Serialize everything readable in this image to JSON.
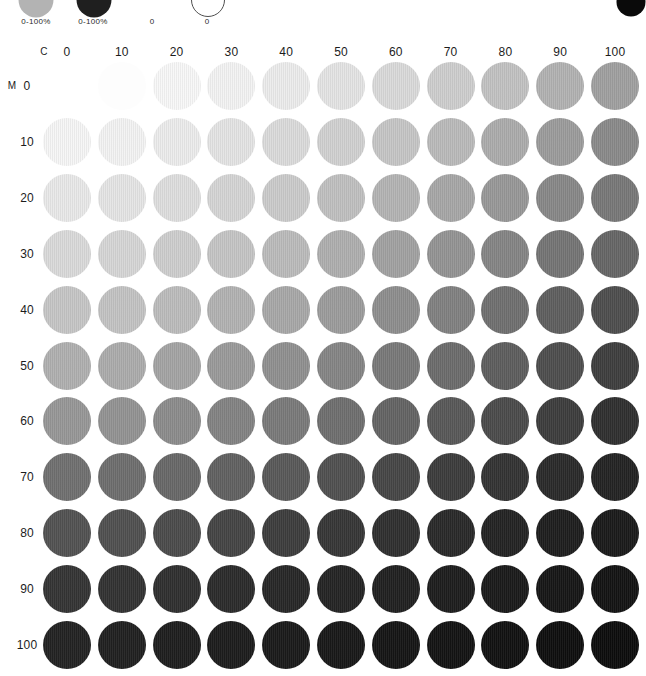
{
  "page": {
    "background": "#ffffff",
    "text_color": "#1c1c1c"
  },
  "legend": {
    "items": [
      {
        "id": "cyan-scale",
        "label": "0-100%",
        "swatch_style": "filled",
        "swatch_color": "#b3b3b3"
      },
      {
        "id": "magenta-scale",
        "label": "0-100%",
        "swatch_style": "filled",
        "swatch_color": "#1f1f1f"
      },
      {
        "id": "yellow-zero",
        "label": "0",
        "swatch_style": "invisible",
        "swatch_color": "#ffffff"
      },
      {
        "id": "black-zero",
        "label": "0",
        "swatch_style": "outlined",
        "swatch_color": "#ffffff",
        "outline_color": "#4f4f4f"
      }
    ]
  },
  "corner_dot": {
    "color": "#0a0a0a"
  },
  "chart_data": {
    "type": "heatmap",
    "x_axis_label": "C",
    "y_axis_label": "M",
    "x_ticks": [
      "0",
      "10",
      "20",
      "30",
      "40",
      "50",
      "60",
      "70",
      "80",
      "90",
      "100"
    ],
    "y_ticks": [
      "0",
      "10",
      "20",
      "30",
      "40",
      "50",
      "60",
      "70",
      "80",
      "90",
      "100"
    ],
    "x_range": [
      0,
      100
    ],
    "y_range": [
      0,
      100
    ],
    "grid": false,
    "legend_position": "top-left",
    "cell_colors": [
      [
        "#ffffff",
        "#fdfdfd",
        "#f8f8f8",
        "#f3f3f3",
        "#ececec",
        "#e4e4e4",
        "#dadada",
        "#cecece",
        "#c2c2c2",
        "#b2b2b2",
        "#a0a0a0"
      ],
      [
        "#f6f6f6",
        "#f3f3f3",
        "#ececec",
        "#e4e4e4",
        "#dbdbdb",
        "#d1d1d1",
        "#c6c6c6",
        "#bababa",
        "#acacac",
        "#9c9c9c",
        "#8a8a8a"
      ],
      [
        "#e9e9e9",
        "#e5e5e5",
        "#dedede",
        "#d5d5d5",
        "#cbcbcb",
        "#c0c0c0",
        "#b4b4b4",
        "#a7a7a7",
        "#989898",
        "#888888",
        "#787878"
      ],
      [
        "#dadada",
        "#d6d6d6",
        "#cecece",
        "#c5c5c5",
        "#bbbbbb",
        "#afafaf",
        "#a2a2a2",
        "#949494",
        "#858585",
        "#757575",
        "#666666"
      ],
      [
        "#c6c6c6",
        "#c3c3c3",
        "#bcbcbc",
        "#b2b2b2",
        "#a8a8a8",
        "#9c9c9c",
        "#8e8e8e",
        "#818181",
        "#707070",
        "#5f5f5f",
        "#4e4e4e"
      ],
      [
        "#b0b0b0",
        "#acacac",
        "#a4a4a4",
        "#9a9a9a",
        "#909090",
        "#858585",
        "#797979",
        "#6c6c6c",
        "#5e5e5e",
        "#4e4e4e",
        "#3e3e3e"
      ],
      [
        "#979797",
        "#939393",
        "#8c8c8c",
        "#838383",
        "#7a7a7a",
        "#6f6f6f",
        "#646464",
        "#585858",
        "#4b4b4b",
        "#3d3d3d",
        "#2f2f2f"
      ],
      [
        "#707070",
        "#6e6e6e",
        "#686868",
        "#616161",
        "#595959",
        "#505050",
        "#464646",
        "#3c3c3c",
        "#333333",
        "#2a2a2a",
        "#232323"
      ],
      [
        "#525252",
        "#505050",
        "#4b4b4b",
        "#444444",
        "#3d3d3d",
        "#363636",
        "#2f2f2f",
        "#292929",
        "#232323",
        "#1e1e1e",
        "#1a1a1a"
      ],
      [
        "#343434",
        "#323232",
        "#2f2f2f",
        "#2b2b2b",
        "#272727",
        "#242424",
        "#202020",
        "#1d1d1d",
        "#1a1a1a",
        "#161616",
        "#131313"
      ],
      [
        "#222222",
        "#202020",
        "#1e1e1e",
        "#1c1c1c",
        "#1a1a1a",
        "#181818",
        "#151515",
        "#131313",
        "#111111",
        "#0e0e0e",
        "#0c0c0c"
      ]
    ]
  }
}
